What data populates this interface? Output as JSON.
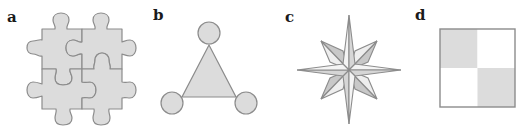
{
  "figure": {
    "panels": [
      {
        "id": "a",
        "label": "a",
        "shape": "jigsaw-puzzle-2x2"
      },
      {
        "id": "b",
        "label": "b",
        "shape": "triangle-with-three-circles"
      },
      {
        "id": "c",
        "label": "c",
        "shape": "eight-pointed-star"
      },
      {
        "id": "d",
        "label": "d",
        "shape": "checkerboard-2x2"
      }
    ]
  },
  "colors": {
    "fill": "#dcdcdc",
    "fill_light": "#f2f2f2",
    "fill_mid": "#c8c8c8",
    "stroke": "#8c8c8c",
    "label": "#1a1a1a",
    "background": "#ffffff"
  }
}
